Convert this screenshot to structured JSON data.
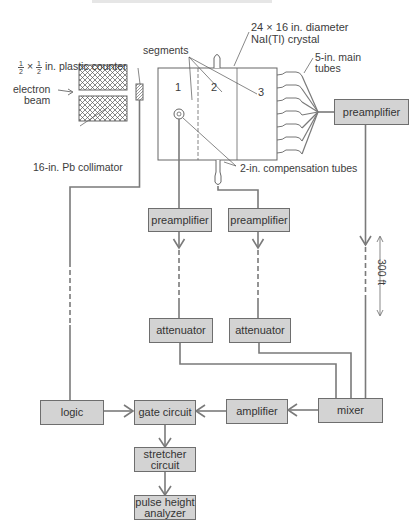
{
  "diagram": {
    "type": "block-diagram",
    "header_running_text": "",
    "labels": {
      "crystal": "24 × 16 in. diameter",
      "crystal_line2": "NaI(Tl) crystal",
      "segments": "segments",
      "main_tubes": "5-in. main",
      "main_tubes_line2": "tubes",
      "plastic_counter_num": "1",
      "plastic_counter_den": "2",
      "plastic_counter_x": "×",
      "plastic_counter": "in. plastic counter",
      "electron_beam": "electron",
      "electron_beam_line2": "beam",
      "collimator": "16-in. Pb collimator",
      "compensation_tubes": "2-in. compensation tubes",
      "distance": "300 ft",
      "segment_1": "1",
      "segment_2": "2",
      "segment_3": "3"
    },
    "blocks": {
      "preamp_main": "preamplifier",
      "preamp_1": "preamplifier",
      "preamp_2": "preamplifier",
      "attenuator_1": "attenuator",
      "attenuator_2": "attenuator",
      "logic": "logic",
      "gate_circuit": "gate circuit",
      "amplifier": "amplifier",
      "mixer": "mixer",
      "stretcher_line1": "stretcher",
      "stretcher_line2": "circuit",
      "pha_line1": "pulse height",
      "pha_line2": "analyzer"
    },
    "connections": [
      {
        "from": "main tubes",
        "to": "preamp_main"
      },
      {
        "from": "preamp_main",
        "to": "mixer",
        "note": "300 ft cable"
      },
      {
        "from": "compensation tube 1",
        "to": "preamp_1"
      },
      {
        "from": "compensation tube 2",
        "to": "preamp_2"
      },
      {
        "from": "preamp_1",
        "to": "attenuator_1"
      },
      {
        "from": "preamp_2",
        "to": "attenuator_2"
      },
      {
        "from": "attenuator_1",
        "to": "mixer"
      },
      {
        "from": "attenuator_2",
        "to": "mixer"
      },
      {
        "from": "plastic counter",
        "to": "logic"
      },
      {
        "from": "logic",
        "to": "gate_circuit"
      },
      {
        "from": "mixer",
        "to": "amplifier"
      },
      {
        "from": "amplifier",
        "to": "gate_circuit"
      },
      {
        "from": "gate_circuit",
        "to": "stretcher"
      },
      {
        "from": "stretcher",
        "to": "pulse height analyzer"
      }
    ],
    "colors": {
      "box_fill": "#d3d3d3",
      "box_border": "#6e6e6e",
      "wire": "#7a7a7a",
      "text": "#3a3a3a"
    }
  }
}
